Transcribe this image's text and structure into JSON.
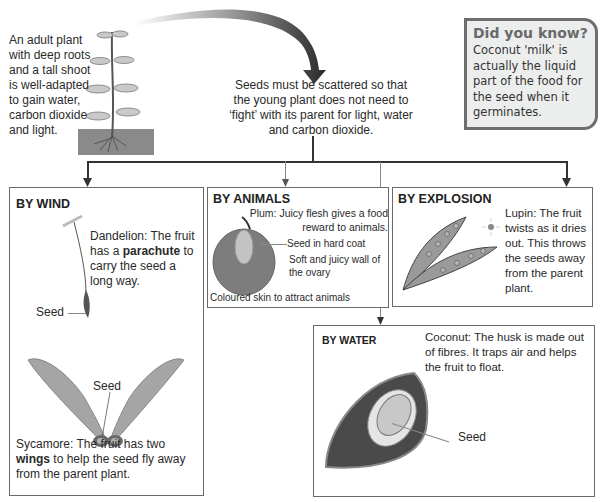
{
  "intro": {
    "adult_plant_text": "An adult plant with deep roots and a tall shoot is well-adapted to gain water, carbon dioxide and light.",
    "scatter_text": "Seeds must be scattered so that the young plant does not need to ‘fight’ with its parent for light, water and carbon dioxide."
  },
  "did_you_know": {
    "title": "Did you know?",
    "body": "Coconut 'milk' is actually the liquid part of the food for the seed when it germinates."
  },
  "wind": {
    "title": "BY WIND",
    "dandelion_prefix": "Dandelion: The fruit has a ",
    "dandelion_bold": "parachute",
    "dandelion_suffix": " to carry the seed a long way.",
    "dandelion_seed_label": "Seed",
    "sycamore_seed_label": "Seed",
    "sycamore_prefix": "Sycamore: The fruit has two ",
    "sycamore_bold": "wings",
    "sycamore_suffix": " to help the seed fly away from the parent plant."
  },
  "animals": {
    "title": "BY ANIMALS",
    "plum_text": "Plum: Juicy flesh gives a food reward to animals.",
    "label_seed": "Seed in hard coat",
    "label_wall": "Soft and juicy wall of the ovary",
    "label_skin": "Coloured skin to attract animals"
  },
  "explosion": {
    "title": "BY EXPLOSION",
    "lupin_text": "Lupin: The fruit twists as it dries out. This throws the seeds away from the parent plant."
  },
  "water": {
    "title": "BY WATER",
    "coconut_text": "Coconut: The husk is made out of fibres. It traps air and helps the fruit to float.",
    "seed_label": "Seed"
  },
  "colors": {
    "line": "#333333",
    "box_border": "#6a6a6a",
    "did_bg": "#eceded",
    "did_border": "#6e6e6e",
    "husk": "#4a4a4a",
    "fruit_grey": "#8a8a8a"
  }
}
